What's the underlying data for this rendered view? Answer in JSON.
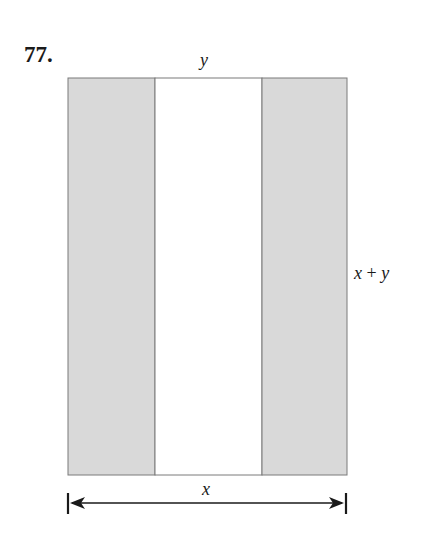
{
  "problem": {
    "number": "77."
  },
  "figure": {
    "labels": {
      "top": "y",
      "right_var1": "x",
      "right_op": "+",
      "right_var2": "y",
      "bottom": "x"
    },
    "regions": [
      {
        "name": "left-strip",
        "shaded": true
      },
      {
        "name": "middle-strip",
        "shaded": false
      },
      {
        "name": "right-strip",
        "shaded": true
      }
    ],
    "colors": {
      "shade": "#d9d9d9",
      "border": "#7a7a7a",
      "arrow": "#1a1a1a"
    }
  }
}
